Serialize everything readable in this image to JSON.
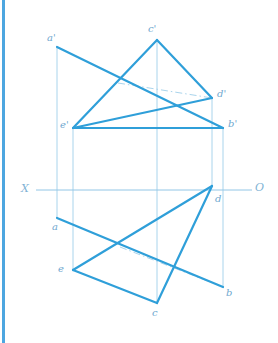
{
  "drawing": {
    "title": "Descriptive geometry two-view projection of pentagon ABCDE",
    "type": "engineering-line-drawing",
    "colors": {
      "solid_line": "#2f9fd9",
      "thin_line": "#a9d4ec",
      "axis_line": "#92c6e6",
      "label_text": "#6fa8cf",
      "accent_stripe": "#4da6e0",
      "background": "#ffffff"
    },
    "axis": {
      "left_label": "X",
      "right_label": "O",
      "y": 190,
      "x_start": 36,
      "x_end": 252
    },
    "points": {
      "a_prime": {
        "label": "a'",
        "x": 57,
        "y": 47,
        "label_x": 47,
        "label_y": 33
      },
      "c_prime": {
        "label": "c'",
        "x": 157,
        "y": 40,
        "label_x": 148,
        "label_y": 24
      },
      "d_prime": {
        "label": "d'",
        "x": 212,
        "y": 98,
        "label_x": 217,
        "label_y": 89
      },
      "b_prime": {
        "label": "b'",
        "x": 223,
        "y": 128,
        "label_x": 228,
        "label_y": 119
      },
      "e_prime": {
        "label": "e'",
        "x": 73,
        "y": 128,
        "label_x": 60,
        "label_y": 120
      },
      "a": {
        "label": "a",
        "x": 57,
        "y": 218,
        "label_x": 52,
        "label_y": 222
      },
      "d": {
        "label": "d",
        "x": 212,
        "y": 186,
        "label_x": 215,
        "label_y": 194
      },
      "e": {
        "label": "e",
        "x": 73,
        "y": 270,
        "label_x": 58,
        "label_y": 264
      },
      "c": {
        "label": "c",
        "x": 157,
        "y": 303,
        "label_x": 152,
        "label_y": 308
      },
      "b": {
        "label": "b",
        "x": 223,
        "y": 287,
        "label_x": 226,
        "label_y": 288
      }
    },
    "solid_edges": [
      {
        "name": "front-view-a-prime-to-b-prime",
        "x1": 57,
        "y1": 47,
        "x2": 223,
        "y2": 128
      },
      {
        "name": "front-view-c-prime-to-e-prime",
        "x1": 157,
        "y1": 40,
        "x2": 73,
        "y2": 128
      },
      {
        "name": "front-view-c-prime-to-d-prime",
        "x1": 157,
        "y1": 40,
        "x2": 212,
        "y2": 98
      },
      {
        "name": "front-view-e-prime-to-b-prime",
        "x1": 73,
        "y1": 128,
        "x2": 223,
        "y2": 128
      },
      {
        "name": "front-view-e-prime-to-d-prime-visible",
        "x1": 73,
        "y1": 128,
        "x2": 212,
        "y2": 98
      },
      {
        "name": "top-view-a-to-b",
        "x1": 57,
        "y1": 218,
        "x2": 223,
        "y2": 287
      },
      {
        "name": "top-view-d-to-e",
        "x1": 212,
        "y1": 186,
        "x2": 73,
        "y2": 270
      },
      {
        "name": "top-view-d-to-c",
        "x1": 212,
        "y1": 186,
        "x2": 157,
        "y2": 303
      },
      {
        "name": "top-view-e-to-c",
        "x1": 73,
        "y1": 270,
        "x2": 157,
        "y2": 303
      }
    ],
    "hidden_edges": [
      {
        "name": "front-view-hidden-e-prime-d-prime",
        "x1": 118,
        "y1": 83,
        "x2": 212,
        "y2": 98
      },
      {
        "name": "top-view-hidden-e-b",
        "x1": 120,
        "y1": 247,
        "x2": 223,
        "y2": 287
      }
    ],
    "projection_lines": [
      {
        "name": "projector-a",
        "x": 57,
        "y1": 47,
        "y2": 218
      },
      {
        "name": "projector-e",
        "x": 73,
        "y1": 128,
        "y2": 270
      },
      {
        "name": "projector-c",
        "x": 157,
        "y1": 40,
        "y2": 303
      },
      {
        "name": "projector-d",
        "x": 212,
        "y1": 98,
        "y2": 186
      },
      {
        "name": "projector-b",
        "x": 223,
        "y1": 128,
        "y2": 287
      }
    ]
  }
}
